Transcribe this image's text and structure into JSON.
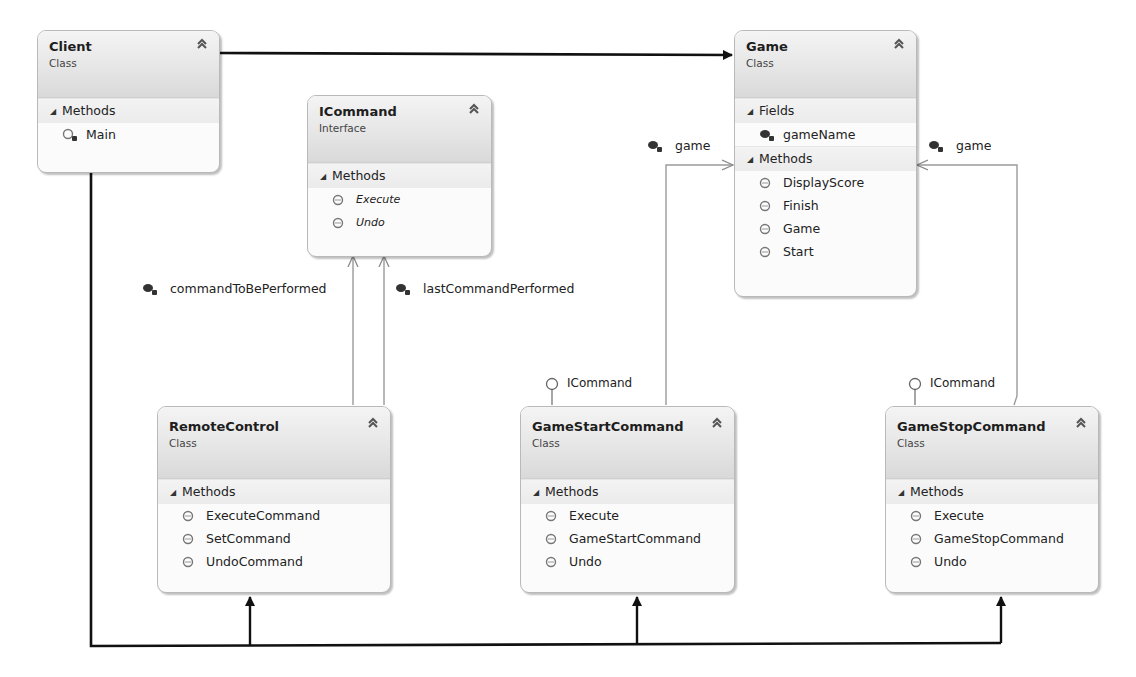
{
  "diagram": {
    "type": "uml-class-diagram",
    "colors": {
      "header_top": "#f4f4f4",
      "header_bottom": "#d9d9d9",
      "border": "#b9b9b9",
      "association_line": "#111111",
      "reference_line": "#9a9a9a"
    },
    "classes": {
      "client": {
        "name": "Client",
        "kind": "Class",
        "sections": [
          {
            "title": "Methods",
            "members": [
              {
                "name": "Main",
                "icon": "private-static-method-icon"
              }
            ]
          }
        ]
      },
      "icommand": {
        "name": "ICommand",
        "kind": "Interface",
        "sections": [
          {
            "title": "Methods",
            "members": [
              {
                "name": "Execute",
                "icon": "method-icon"
              },
              {
                "name": "Undo",
                "icon": "method-icon"
              }
            ]
          }
        ]
      },
      "game": {
        "name": "Game",
        "kind": "Class",
        "sections": [
          {
            "title": "Fields",
            "members": [
              {
                "name": "gameName",
                "icon": "private-field-icon"
              }
            ]
          },
          {
            "title": "Methods",
            "members": [
              {
                "name": "DisplayScore",
                "icon": "method-icon"
              },
              {
                "name": "Finish",
                "icon": "method-icon"
              },
              {
                "name": "Game",
                "icon": "method-icon"
              },
              {
                "name": "Start",
                "icon": "method-icon"
              }
            ]
          }
        ]
      },
      "remotecontrol": {
        "name": "RemoteControl",
        "kind": "Class",
        "sections": [
          {
            "title": "Methods",
            "members": [
              {
                "name": "ExecuteCommand",
                "icon": "method-icon"
              },
              {
                "name": "SetCommand",
                "icon": "method-icon"
              },
              {
                "name": "UndoCommand",
                "icon": "method-icon"
              }
            ]
          }
        ]
      },
      "gamestartcommand": {
        "name": "GameStartCommand",
        "kind": "Class",
        "implements": "ICommand",
        "sections": [
          {
            "title": "Methods",
            "members": [
              {
                "name": "Execute",
                "icon": "method-icon"
              },
              {
                "name": "GameStartCommand",
                "icon": "method-icon"
              },
              {
                "name": "Undo",
                "icon": "method-icon"
              }
            ]
          }
        ]
      },
      "gamestopcommand": {
        "name": "GameStopCommand",
        "kind": "Class",
        "implements": "ICommand",
        "sections": [
          {
            "title": "Methods",
            "members": [
              {
                "name": "Execute",
                "icon": "method-icon"
              },
              {
                "name": "GameStopCommand",
                "icon": "method-icon"
              },
              {
                "name": "Undo",
                "icon": "method-icon"
              }
            ]
          }
        ]
      }
    },
    "associations": {
      "command_to_be_performed": "commandToBePerformed",
      "last_command_performed": "lastCommandPerformed",
      "game_from_start": "game",
      "game_from_stop": "game"
    },
    "lollipops": {
      "start_impl": "ICommand",
      "stop_impl": "ICommand"
    }
  }
}
